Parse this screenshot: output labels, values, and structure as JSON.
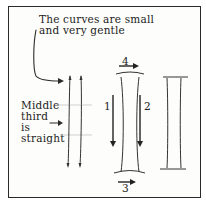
{
  "diagram": {
    "caption_top": [
      "The curves are small",
      "and very gentle"
    ],
    "caption_left": [
      "Middle",
      "third",
      "is",
      "straight"
    ],
    "stroke_labels": {
      "one": "1",
      "two": "2",
      "three": "3",
      "four": "4"
    },
    "colors": {
      "ink": "#222222",
      "guide": "#bbbbbb",
      "paper": "#fdfdfb"
    }
  }
}
